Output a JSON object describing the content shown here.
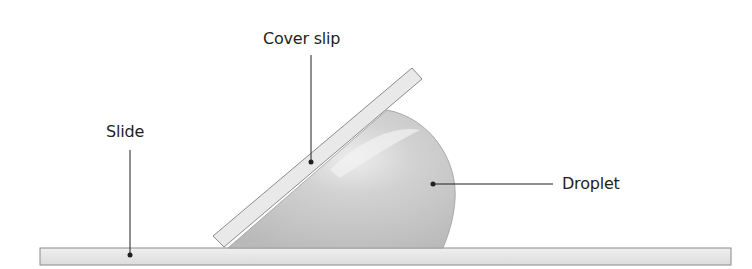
{
  "diagram": {
    "type": "hanging-drop / cover slip mounting schematic",
    "labels": {
      "cover_slip": "Cover slip",
      "slide": "Slide",
      "droplet": "Droplet"
    },
    "colors": {
      "slide_fill": "#e6e6e6",
      "slide_stroke": "#8a8a8a",
      "cover_slip_fill": "#e9e9e9",
      "droplet_fill": "#c4c4c4",
      "droplet_highlight": "#ececec",
      "leader_line": "#231f20"
    }
  }
}
